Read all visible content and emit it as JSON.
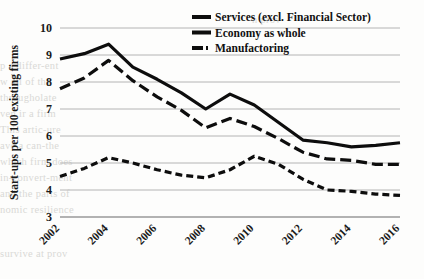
{
  "chart_data": {
    "type": "line",
    "title": "",
    "xlabel": "",
    "ylabel": "Start-ups per 100 existing firms",
    "x": [
      2002,
      2003,
      2004,
      2005,
      2006,
      2007,
      2008,
      2009,
      2010,
      2011,
      2012,
      2013,
      2014,
      2015,
      2016
    ],
    "xtick_labels": [
      "2002",
      "2004",
      "2006",
      "2008",
      "2010",
      "2012",
      "2014",
      "2016"
    ],
    "xticks": [
      2002,
      2004,
      2006,
      2008,
      2010,
      2012,
      2014,
      2016
    ],
    "ytick_labels": [
      "3",
      "4",
      "5",
      "6",
      "7",
      "8",
      "9",
      "10"
    ],
    "yticks": [
      3,
      4,
      5,
      6,
      7,
      8,
      9,
      10
    ],
    "ylim": [
      3,
      10
    ],
    "xlim": [
      2002,
      2016
    ],
    "grid": "horizontal",
    "legend_position": "top-right",
    "series": [
      {
        "name": "Services (excl. Financial Sector)",
        "style": "solid",
        "width": 3.2,
        "color": "#0d0d0d",
        "values": [
          8.85,
          9.05,
          9.4,
          8.55,
          8.1,
          7.6,
          7.0,
          7.55,
          7.15,
          6.5,
          5.85,
          5.75,
          5.6,
          5.65,
          5.75
        ]
      },
      {
        "name": "Economy as whole",
        "style": "dashed-long",
        "width": 3.2,
        "color": "#0d0d0d",
        "values": [
          7.75,
          8.15,
          8.8,
          8.05,
          7.45,
          6.95,
          6.3,
          6.65,
          6.35,
          5.9,
          5.4,
          5.15,
          5.1,
          4.95,
          4.95
        ]
      },
      {
        "name": "Manufactoring",
        "style": "dashed-short",
        "width": 3.2,
        "color": "#0d0d0d",
        "values": [
          4.5,
          4.8,
          5.2,
          5.0,
          4.75,
          4.55,
          4.45,
          4.75,
          5.25,
          4.95,
          4.4,
          4.0,
          3.95,
          3.85,
          3.8
        ]
      }
    ]
  },
  "legend": {
    "items": [
      {
        "label": "Services (excl. Financial Sector)",
        "swatch": "solid-line-swatch"
      },
      {
        "label": "Economy as whole",
        "swatch": "solid-line-swatch"
      },
      {
        "label": "Manufactoring",
        "swatch": "dash-dot-line-swatch"
      }
    ]
  },
  "axes": {
    "y_title": "Start-ups per 100 existing firms",
    "y_tick_labels": [
      "10",
      "9",
      "8",
      "7",
      "6",
      "5",
      "4",
      "3"
    ],
    "x_tick_labels": [
      "2002",
      "2004",
      "2006",
      "2008",
      "2010",
      "2012",
      "2014",
      "2016"
    ]
  },
  "background_artifacts": {
    "note": "faint reverse-side show-through text from the scanned page",
    "lines": [
      "n prov",
      "p a differ-ent",
      "w all of the",
      "througholate",
      "ven ir a firm",
      "This artic-ure",
      "ave a can-the",
      "which firm does",
      "in-convert-ment",
      "and the parts of",
      "nomic resilience",
      "survive at prov"
    ]
  }
}
